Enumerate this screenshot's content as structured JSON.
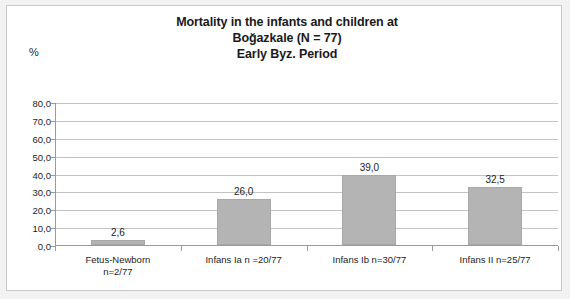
{
  "chart_data": {
    "type": "bar",
    "title": "Mortality in the infants and children at Boğazkale  (N = 77) Early Byz. Period",
    "title_lines": [
      "Mortality in the infants and children at",
      "Boğazkale  (N = 77)",
      "Early Byz. Period"
    ],
    "categories": [
      "Fetus-Newborn n=2/77",
      "Infans Ia n =20/77",
      "Infans Ib n=30/77",
      "Infans II n=25/77"
    ],
    "category_lines": [
      [
        "Fetus-Newborn",
        "n=2/77"
      ],
      [
        "Infans Ia n =20/77"
      ],
      [
        "Infans Ib n=30/77"
      ],
      [
        "Infans II n=25/77"
      ]
    ],
    "values": [
      2.6,
      26.0,
      39.0,
      32.5
    ],
    "value_labels": [
      "2,6",
      "26,0",
      "39,0",
      "32,5"
    ],
    "xlabel": "",
    "ylabel": "%",
    "ylim": [
      0,
      80
    ],
    "ytick_step": 10,
    "ytick_labels": [
      "80,0",
      "70,0",
      "60,0",
      "50,0",
      "40,0",
      "30,0",
      "20,0",
      "10,0",
      "0,0"
    ],
    "ytick_values": [
      80,
      70,
      60,
      50,
      40,
      30,
      20,
      10,
      0
    ],
    "grid": true,
    "legend": false,
    "colors": {
      "bar_fill": "#b4b4b4",
      "bar_border": "#a8a8a8",
      "gridline": "#c3c3c3",
      "axis": "#9a9a9a",
      "text": "#1d1d1d",
      "title": "#1a1a1a",
      "plot_background": "#ffffff",
      "page_background": "#f2f2f2"
    }
  }
}
